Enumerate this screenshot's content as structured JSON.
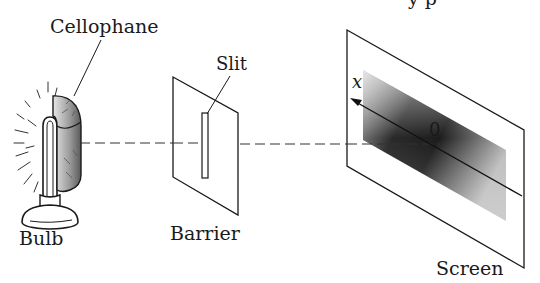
{
  "figure": {
    "topFragment": "y p",
    "labels": {
      "cellophane": "Cellophane",
      "slit": "Slit",
      "bulb": "Bulb",
      "barrier": "Barrier",
      "screen": "Screen",
      "axisVariable": "x",
      "origin": "0"
    },
    "colors": {
      "ink": "#1a1a1a",
      "background": "#ffffff",
      "bandDark": "#1c1c1c",
      "bandLight": "#bdbdbd",
      "cellophane": "#8a8a8a"
    },
    "components": [
      {
        "id": "bulb",
        "description": "glowing light bulb on a stand"
      },
      {
        "id": "cellophane",
        "description": "curved cellophane filter wrapped around half of bulb"
      },
      {
        "id": "barrier",
        "description": "flat barrier plate with a single vertical slit"
      },
      {
        "id": "screen",
        "description": "viewing screen with shaded intensity band and x-axis through origin 0"
      }
    ],
    "beam": {
      "style": "dashed",
      "path": "bulb → slit → screen origin"
    }
  }
}
